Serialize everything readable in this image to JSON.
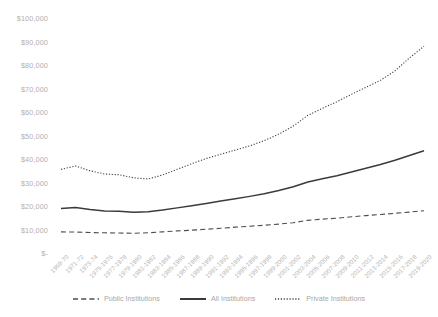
{
  "chart_data": {
    "type": "line",
    "title": "",
    "xlabel": "",
    "ylabel": "",
    "ylim": [
      0,
      100000
    ],
    "ytick_labels": [
      "$100,000",
      "$90,000",
      "$80,000",
      "$70,000",
      "$60,000",
      "$50,000",
      "$40,000",
      "$30,000",
      "$20,000",
      "$10,000",
      "$-"
    ],
    "ytick_values": [
      100000,
      90000,
      80000,
      70000,
      60000,
      50000,
      40000,
      30000,
      20000,
      10000,
      0
    ],
    "grid": false,
    "legend_position": "bottom-center",
    "categories": [
      "1969-70",
      "1971-72",
      "1973-74",
      "1975-1976",
      "1977-1978",
      "1979-1980",
      "1981-1982",
      "1983-1984",
      "1985-1986",
      "1987-1988",
      "1989-1990",
      "1991-1992",
      "1993-1994",
      "1995-1996",
      "1997-1998",
      "1999-2000",
      "2001-2002",
      "2003-2004",
      "2005-2006",
      "2007-2008",
      "2009-2010",
      "2011-2012",
      "2013-2014",
      "2015-2016",
      "2017-2018",
      "2019-2020"
    ],
    "series": [
      {
        "name": "Public Institutions",
        "style": "dashed",
        "color": "#4d4d4d",
        "values": [
          9000,
          8900,
          8700,
          8600,
          8500,
          8400,
          8600,
          9000,
          9400,
          9700,
          10100,
          10500,
          11000,
          11400,
          11800,
          12300,
          12900,
          13900,
          14400,
          14800,
          15400,
          15900,
          16400,
          16900,
          17400,
          18000
        ]
      },
      {
        "name": "All Institutions",
        "style": "solid",
        "color": "#3b3b3b",
        "values": [
          18900,
          19400,
          18500,
          17900,
          17800,
          17300,
          17600,
          18300,
          19200,
          20100,
          21100,
          22100,
          23100,
          24100,
          25200,
          26600,
          28200,
          30200,
          31600,
          32900,
          34500,
          36100,
          37700,
          39500,
          41500,
          43500
        ]
      },
      {
        "name": "Private Institutions",
        "style": "dotted",
        "color": "#404040",
        "values": [
          35600,
          37000,
          35000,
          33600,
          33300,
          32000,
          31500,
          33200,
          35600,
          38000,
          40200,
          42000,
          43800,
          45600,
          47800,
          50600,
          54000,
          58600,
          61500,
          64400,
          67500,
          70500,
          73500,
          77500,
          83000,
          88000
        ]
      }
    ]
  },
  "legend": {
    "items": [
      {
        "label": "Public Institutions",
        "style": "dashed"
      },
      {
        "label": "All Institutions",
        "style": "solid"
      },
      {
        "label": "Private Institutions",
        "style": "dotted"
      }
    ]
  }
}
